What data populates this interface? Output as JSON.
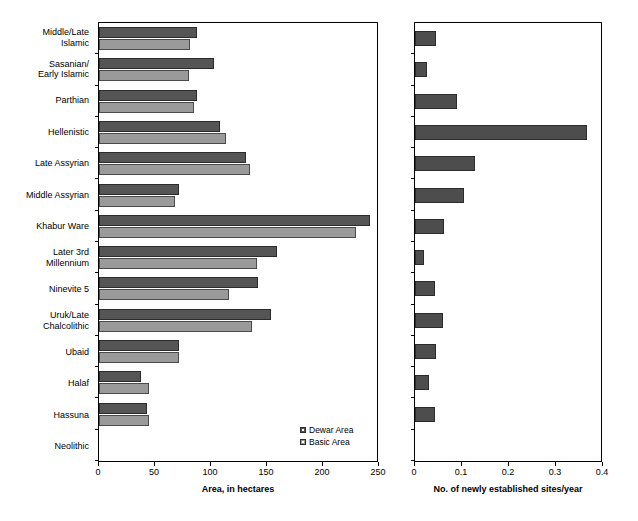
{
  "chart_data": [
    {
      "type": "bar",
      "orientation": "horizontal",
      "title": "",
      "xlabel": "Area, in hectares",
      "ylabel": "Period",
      "xlim": [
        0,
        250
      ],
      "xticks": [
        0,
        50,
        100,
        150,
        200,
        250
      ],
      "xtick_labels": [
        "0",
        "50",
        "100",
        "150",
        "200",
        "250"
      ],
      "grid": false,
      "legend_position": "bottom-right-inside",
      "categories": [
        "Middle/Late\nIslamic",
        "Sasanian/\nEarly Islamic",
        "Parthian",
        "Hellenistic",
        "Late Assyrian",
        "Middle Assyrian",
        "Khabur Ware",
        "Later 3rd\nMillennium",
        "Ninevite 5",
        "Uruk/Late\nChalcolithic",
        "Ubaid",
        "Halaf",
        "Hassuna",
        "Neolithic"
      ],
      "series": [
        {
          "name": "Dewar Area",
          "color": "#555555",
          "values": [
            88,
            103,
            88,
            109,
            132,
            72,
            244,
            160,
            143,
            155,
            72,
            38,
            43,
            0
          ]
        },
        {
          "name": "Basic Area",
          "color": "#9a9a9a",
          "values": [
            82,
            81,
            85,
            114,
            136,
            68,
            231,
            142,
            117,
            138,
            72,
            45,
            45,
            0
          ]
        }
      ]
    },
    {
      "type": "bar",
      "orientation": "horizontal",
      "title": "",
      "xlabel": "No. of newly established sites/year",
      "ylabel": "",
      "xlim": [
        0,
        0.4
      ],
      "xticks": [
        0,
        0.1,
        0.2,
        0.3,
        0.4
      ],
      "xtick_labels": [
        "0",
        "0.1",
        "0.2",
        "0.3",
        "0.4"
      ],
      "grid": false,
      "legend_position": "none",
      "categories": [
        "Middle/Late Islamic",
        "Sasanian/Early Islamic",
        "Parthian",
        "Hellenistic",
        "Late Assyrian",
        "Middle Assyrian",
        "Khabur Ware",
        "Later 3rd Millennium",
        "Ninevite 5",
        "Uruk/Late Chalcolithic",
        "Ubaid",
        "Halaf",
        "Hassuna",
        "Neolithic"
      ],
      "series": [
        {
          "name": "No. of newly established sites/year",
          "color": "#4d4d4d",
          "values": [
            0.045,
            0.025,
            0.09,
            0.37,
            0.128,
            0.105,
            0.062,
            0.02,
            0.042,
            0.06,
            0.045,
            0.03,
            0.042,
            0
          ]
        }
      ]
    }
  ],
  "legend": {
    "items": [
      {
        "label": "Dewar Area",
        "color": "#555555"
      },
      {
        "label": "Basic Area",
        "color": "#9a9a9a"
      }
    ]
  }
}
